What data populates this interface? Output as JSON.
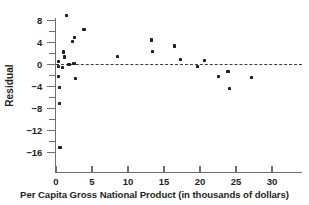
{
  "chart_data": {
    "type": "scatter",
    "title": "",
    "xlabel": "Per Capita Gross National Product (in thousands of dollars)",
    "ylabel": "Residual",
    "xlim": [
      0,
      30
    ],
    "ylim": [
      -17.5,
      10.0
    ],
    "xticks": [
      0,
      5,
      10,
      15,
      20,
      25,
      30
    ],
    "xtick_labels": [
      "0",
      "5",
      "10",
      "15",
      "20",
      "25",
      "30"
    ],
    "yticks": [
      8,
      4,
      0,
      -4,
      -8,
      -12,
      -16
    ],
    "ytick_labels": [
      "8",
      "4",
      "0",
      "−4",
      "−8",
      "−12",
      "−16"
    ],
    "yticks_minor": [
      10,
      6,
      2,
      -2,
      -6,
      -10,
      -14
    ],
    "grid": false,
    "legend": null,
    "reference_line": {
      "type": "horizontal",
      "y": 0,
      "style": "dashed",
      "color": "#3b3b3b"
    },
    "marker": {
      "shape": "square",
      "color": "#231f20",
      "size": 3.2
    },
    "points": [
      {
        "x": 0.35,
        "y": 0.6
      },
      {
        "x": 0.35,
        "y": -0.3
      },
      {
        "x": 0.4,
        "y": -2.2
      },
      {
        "x": 0.45,
        "y": -4.2
      },
      {
        "x": 0.5,
        "y": -7.0
      },
      {
        "x": 0.55,
        "y": -15.1
      },
      {
        "x": 0.9,
        "y": -0.5
      },
      {
        "x": 1.0,
        "y": 2.3
      },
      {
        "x": 1.15,
        "y": 1.4
      },
      {
        "x": 1.5,
        "y": 8.9
      },
      {
        "x": 1.7,
        "y": 0.1
      },
      {
        "x": 1.9,
        "y": 0.1
      },
      {
        "x": 2.3,
        "y": 4.2
      },
      {
        "x": 2.5,
        "y": 0.2
      },
      {
        "x": 2.55,
        "y": 4.9
      },
      {
        "x": 2.7,
        "y": -2.5
      },
      {
        "x": 3.9,
        "y": 6.4
      },
      {
        "x": 8.5,
        "y": 1.5
      },
      {
        "x": 13.3,
        "y": 4.5
      },
      {
        "x": 13.4,
        "y": 2.4
      },
      {
        "x": 16.5,
        "y": 3.4
      },
      {
        "x": 17.3,
        "y": 1.0
      },
      {
        "x": 19.7,
        "y": -0.4
      },
      {
        "x": 20.6,
        "y": 0.8
      },
      {
        "x": 22.6,
        "y": -2.2
      },
      {
        "x": 23.9,
        "y": -1.2
      },
      {
        "x": 24.1,
        "y": -4.3
      },
      {
        "x": 27.2,
        "y": -2.3
      }
    ]
  }
}
